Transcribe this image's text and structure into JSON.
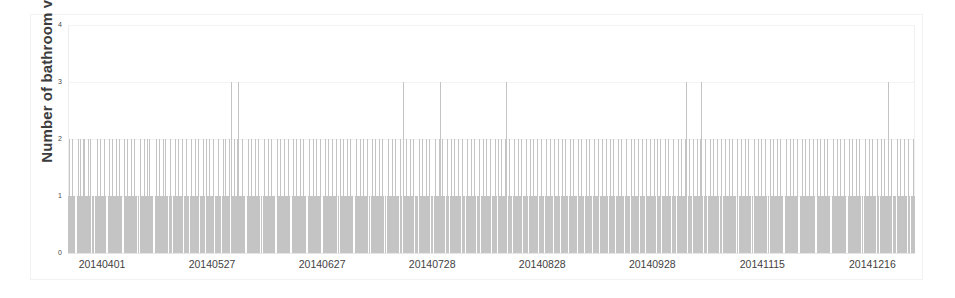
{
  "chart_data": {
    "type": "bar",
    "title": "",
    "subtitle": "",
    "xlabel": "",
    "ylabel": "Number of bathroom visits",
    "ylim": [
      0,
      4
    ],
    "yticks": [
      0,
      1,
      2,
      3,
      4
    ],
    "ytick_labels": [
      "0",
      "1",
      "2",
      "3",
      "4"
    ],
    "grid": true,
    "legend": null,
    "bar_color": "#c4c4c4",
    "grid_color": "#f3f3f3",
    "text_color": "#3f3f3f",
    "x_is_categorical_dates": true,
    "xtick_labels": [
      "20140401",
      "20140527",
      "20140627",
      "20140728",
      "20140828",
      "20140928",
      "20141115",
      "20141216"
    ],
    "xtick_positions": [
      0,
      102,
      204,
      306,
      408,
      510,
      612,
      714
    ],
    "n_bars": 785,
    "values": [
      1,
      2,
      1,
      1,
      2,
      1,
      1,
      0,
      1,
      2,
      1,
      2,
      1,
      1,
      2,
      2,
      1,
      1,
      1,
      2,
      1,
      2,
      1,
      1,
      0,
      1,
      1,
      2,
      1,
      1,
      2,
      1,
      1,
      1,
      2,
      1,
      0,
      1,
      2,
      1,
      1,
      2,
      1,
      1,
      1,
      2,
      1,
      1,
      2,
      1,
      1,
      0,
      2,
      1,
      1,
      2,
      1,
      1,
      1,
      2,
      1,
      1,
      2,
      1,
      1,
      1,
      0,
      2,
      1,
      1,
      1,
      2,
      1,
      1,
      2,
      1,
      2,
      1,
      1,
      1,
      0,
      1,
      2,
      1,
      1,
      2,
      1,
      1,
      1,
      2,
      1,
      2,
      1,
      1,
      1,
      2,
      1,
      0,
      1,
      1,
      2,
      1,
      1,
      2,
      1,
      1,
      1,
      2,
      1,
      1,
      2,
      1,
      1,
      0,
      1,
      2,
      1,
      1,
      1,
      2,
      1,
      1,
      2,
      1,
      1,
      1,
      2,
      1,
      0,
      2,
      1,
      1,
      2,
      1,
      1,
      1,
      2,
      1,
      1,
      1,
      2,
      1,
      1,
      0,
      1,
      2,
      1,
      2,
      1,
      1,
      1,
      2,
      3,
      1,
      1,
      2,
      1,
      1,
      2,
      3,
      1,
      1,
      1,
      2,
      1,
      1,
      0,
      1,
      2,
      1,
      1,
      2,
      1,
      1,
      1,
      2,
      1,
      1,
      2,
      1,
      1,
      0,
      1,
      2,
      1,
      1,
      1,
      2,
      1,
      1,
      2,
      1,
      1,
      1,
      0,
      2,
      1,
      1,
      2,
      1,
      1,
      1,
      2,
      1,
      1,
      1,
      2,
      1,
      0,
      1,
      2,
      1,
      1,
      2,
      1,
      1,
      1,
      2,
      1,
      1,
      2,
      1,
      1,
      0,
      1,
      2,
      1,
      1,
      1,
      2,
      1,
      1,
      2,
      1,
      1,
      1,
      2,
      0,
      1,
      1,
      2,
      1,
      1,
      2,
      1,
      1,
      1,
      2,
      1,
      1,
      1,
      2,
      1,
      0,
      2,
      1,
      1,
      2,
      1,
      1,
      1,
      2,
      1,
      1,
      2,
      1,
      1,
      0,
      1,
      2,
      1,
      1,
      1,
      2,
      1,
      1,
      2,
      1,
      1,
      1,
      2,
      1,
      0,
      1,
      2,
      1,
      1,
      2,
      1,
      1,
      1,
      2,
      1,
      1,
      2,
      1,
      1,
      0,
      1,
      2,
      1,
      1,
      1,
      2,
      1,
      1,
      2,
      1,
      1,
      1,
      2,
      1,
      0,
      3,
      1,
      1,
      2,
      1,
      1,
      1,
      2,
      1,
      1,
      2,
      1,
      1,
      1,
      0,
      2,
      1,
      1,
      2,
      1,
      1,
      1,
      2,
      1,
      1,
      2,
      1,
      1,
      0,
      1,
      2,
      1,
      1,
      1,
      2,
      3,
      1,
      2,
      1,
      1,
      1,
      2,
      1,
      0,
      1,
      2,
      1,
      1,
      2,
      1,
      1,
      1,
      2,
      1,
      1,
      2,
      1,
      1,
      0,
      1,
      2,
      1,
      1,
      1,
      2,
      1,
      1,
      2,
      1,
      1,
      1,
      2,
      0,
      1,
      1,
      2,
      1,
      1,
      2,
      1,
      1,
      1,
      2,
      1,
      1,
      1,
      2,
      1,
      0,
      2,
      1,
      1,
      2,
      1,
      1,
      1,
      2,
      3,
      1,
      2,
      1,
      1,
      0,
      1,
      2,
      1,
      1,
      1,
      2,
      1,
      1,
      2,
      1,
      1,
      1,
      2,
      1,
      0,
      1,
      2,
      1,
      1,
      2,
      1,
      1,
      1,
      2,
      1,
      1,
      2,
      1,
      1,
      0,
      1,
      2,
      1,
      1,
      1,
      2,
      1,
      1,
      2,
      1,
      1,
      1,
      2,
      1,
      0,
      1,
      2,
      1,
      1,
      2,
      1,
      1,
      1,
      2,
      1,
      1,
      2,
      1,
      1,
      1,
      0,
      2,
      1,
      1,
      2,
      1,
      1,
      1,
      2,
      1,
      1,
      2,
      1,
      1,
      0,
      1,
      2,
      1,
      1,
      1,
      2,
      1,
      1,
      2,
      1,
      1,
      1,
      2,
      1,
      0,
      1,
      2,
      1,
      1,
      2,
      1,
      1,
      1,
      2,
      1,
      1,
      2,
      1,
      1,
      0,
      1,
      2,
      1,
      1,
      1,
      2,
      1,
      1,
      2,
      1,
      1,
      1,
      2,
      0,
      1,
      1,
      2,
      1,
      1,
      2,
      1,
      1,
      1,
      2,
      1,
      1,
      1,
      2,
      1,
      0,
      2,
      1,
      1,
      2,
      1,
      1,
      1,
      2,
      1,
      1,
      2,
      1,
      1,
      0,
      1,
      2,
      1,
      1,
      1,
      2,
      1,
      1,
      2,
      1,
      1,
      1,
      2,
      3,
      0,
      1,
      2,
      1,
      1,
      2,
      1,
      1,
      1,
      2,
      1,
      1,
      2,
      3,
      1,
      0,
      1,
      2,
      1,
      1,
      1,
      2,
      1,
      1,
      2,
      1,
      1,
      1,
      2,
      1,
      0,
      1,
      2,
      1,
      1,
      2,
      1,
      1,
      1,
      2,
      1,
      1,
      2,
      1,
      1,
      1,
      0,
      2,
      1,
      1,
      2,
      1,
      1,
      1,
      2,
      1,
      1,
      2,
      1,
      1,
      0,
      1,
      2,
      1,
      1,
      1,
      2,
      1,
      1,
      2,
      1,
      1,
      1,
      2,
      1,
      0,
      1,
      2,
      1,
      1,
      2,
      1,
      1,
      1,
      2,
      1,
      1,
      2,
      1,
      1,
      0,
      1,
      2,
      1,
      1,
      1,
      2,
      1,
      1,
      2,
      1,
      1,
      1,
      2,
      0,
      1,
      1,
      2,
      1,
      1,
      2,
      1,
      1,
      1,
      2,
      1,
      1,
      1,
      2,
      1,
      0,
      2,
      1,
      1,
      2,
      1,
      1,
      1,
      2,
      1,
      1,
      2,
      1,
      1,
      0,
      1,
      2,
      1,
      1,
      1,
      2,
      1,
      1,
      2,
      1,
      1,
      1,
      2,
      1,
      0,
      1,
      2,
      1,
      1,
      2,
      1,
      1,
      1,
      2,
      1,
      1,
      2,
      1,
      1,
      0,
      1,
      2,
      1,
      1,
      1,
      2,
      1,
      1,
      2,
      1,
      1,
      1,
      2,
      1,
      0,
      1,
      2,
      1,
      1,
      2,
      1,
      1,
      1,
      3,
      1,
      1,
      2,
      1,
      1,
      1,
      0,
      2,
      1,
      1,
      2,
      1,
      1,
      1,
      2,
      1,
      1,
      2,
      1,
      0,
      1,
      1,
      2,
      1
    ]
  },
  "figure": {
    "background": "#ffffff",
    "frame_color": "#f2f2f2"
  }
}
